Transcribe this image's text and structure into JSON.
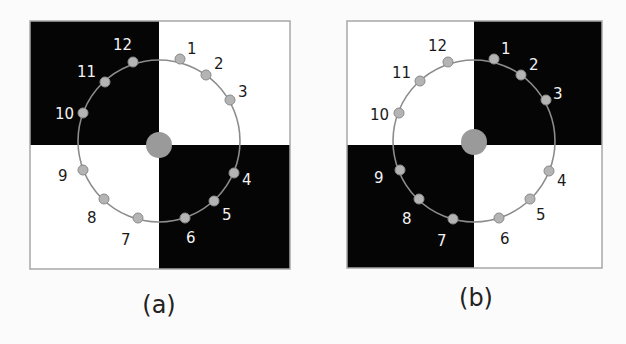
{
  "colors": {
    "background": "#fbfbfb",
    "dark_quadrant": "#050505",
    "light_quadrant": "#ffffff",
    "frame": "#a8a8a8",
    "circle_stroke": "#8c8c8c",
    "dot_fill": "#b4b4b4",
    "dot_stroke": "#8a8a8a",
    "center_fill": "#9a9a9a",
    "label_on_dark": "#f2f2f2",
    "label_on_light": "#1a1a1a"
  },
  "panels": [
    {
      "id": "a",
      "caption": "(a)",
      "dark_quadrants": [
        "top-left",
        "bottom-right"
      ],
      "points": [
        {
          "label": "1"
        },
        {
          "label": "2"
        },
        {
          "label": "3"
        },
        {
          "label": "4"
        },
        {
          "label": "5"
        },
        {
          "label": "6"
        },
        {
          "label": "7"
        },
        {
          "label": "8"
        },
        {
          "label": "9"
        },
        {
          "label": "10"
        },
        {
          "label": "11"
        },
        {
          "label": "12"
        }
      ]
    },
    {
      "id": "b",
      "caption": "(b)",
      "dark_quadrants": [
        "top-right",
        "bottom-left"
      ],
      "points": [
        {
          "label": "1"
        },
        {
          "label": "2"
        },
        {
          "label": "3"
        },
        {
          "label": "4"
        },
        {
          "label": "5"
        },
        {
          "label": "6"
        },
        {
          "label": "7"
        },
        {
          "label": "8"
        },
        {
          "label": "9"
        },
        {
          "label": "10"
        },
        {
          "label": "11"
        },
        {
          "label": "12"
        }
      ]
    }
  ]
}
